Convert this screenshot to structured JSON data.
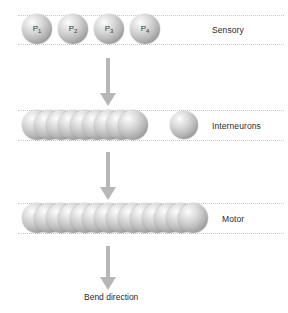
{
  "diagram": {
    "background_color": "#ffffff",
    "sphere_color": "#bcbcbc",
    "arrow_color": "#b7b7b7",
    "guide_line_color": "#c9c9c9",
    "text_color": "#2b2b2b"
  },
  "layers": [
    {
      "id": "sensory",
      "label": "Sensory",
      "neuron_count": 4,
      "neurons": [
        {
          "label": "P",
          "subscript": "1"
        },
        {
          "label": "P",
          "subscript": "2"
        },
        {
          "label": "P",
          "subscript": "3"
        },
        {
          "label": "P",
          "subscript": "4"
        }
      ]
    },
    {
      "id": "interneurons",
      "label": "Interneurons",
      "chain_count": 9,
      "isolated_count": 1
    },
    {
      "id": "motor",
      "label": "Motor",
      "chain_count": 14
    }
  ],
  "arrows": [
    {
      "id": "sensory-to-interneurons"
    },
    {
      "id": "interneurons-to-motor"
    },
    {
      "id": "motor-to-bend"
    }
  ],
  "caption": {
    "text": "Bend direction"
  }
}
